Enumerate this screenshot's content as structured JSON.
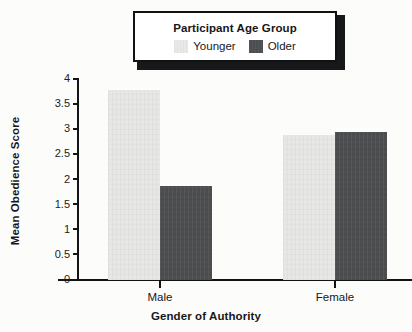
{
  "chart_data": {
    "type": "bar",
    "title": "",
    "xlabel": "Gender of Authority",
    "ylabel": "Mean Obedience Score",
    "categories": [
      "Male",
      "Female"
    ],
    "series": [
      {
        "name": "Younger",
        "values": [
          3.78,
          2.88
        ],
        "color": "#e7e7e6"
      },
      {
        "name": "Older",
        "values": [
          1.88,
          2.95
        ],
        "color": "#4d4e50"
      }
    ],
    "ylim": [
      0,
      4
    ],
    "ytick_values": [
      0,
      0.5,
      1,
      1.5,
      2,
      2.5,
      3,
      3.5,
      4
    ],
    "ytick_labels": [
      "0",
      "0.5",
      "1",
      "1.5",
      "2",
      "2.5",
      "3",
      "3.5",
      "4"
    ],
    "grid": false,
    "legend_position": "top-center",
    "legend_title": "Participant Age Group"
  },
  "legend": {
    "title": "Participant Age Group",
    "entries": [
      {
        "label": "Younger",
        "swatch": "younger-swatch"
      },
      {
        "label": "Older",
        "swatch": "older-swatch"
      }
    ]
  },
  "axes": {
    "y_title": "Mean Obedience Score",
    "x_title": "Gender of Authority",
    "x_categories": [
      "Male",
      "Female"
    ],
    "y_ticks": [
      "4",
      "3.5",
      "3",
      "2.5",
      "2",
      "1.5",
      "1",
      "0.5",
      "0"
    ]
  }
}
